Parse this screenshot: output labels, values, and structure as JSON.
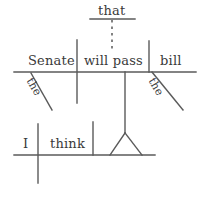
{
  "diagram": {
    "kind": "reed-kellogg-sentence-diagram",
    "sentence": "I think that the Senate will pass the bill.",
    "ink_color": "#555555",
    "text_color": "#3a3a3a",
    "background_color": "#ffffff",
    "width": 202,
    "height": 200,
    "labels": {
      "that": "that",
      "senate": "Senate",
      "will_pass": "will pass",
      "bill": "bill",
      "the_left": "the",
      "the_right": "the",
      "i": "I",
      "think": "think"
    },
    "clauses": {
      "main_clause": {
        "subject": "I",
        "verb": "think",
        "baseline_y": 155,
        "baseline_x1": 14,
        "baseline_x2": 155
      },
      "subordinate_clause": {
        "conjunction": "that",
        "subject": "Senate",
        "subject_modifier": "the",
        "verb": "will pass",
        "object": "bill",
        "object_modifier": "the",
        "baseline_y": 72,
        "baseline_x1": 14,
        "baseline_x2": 196
      }
    },
    "strokes": {
      "upper_baseline": "14,72 to 196,72",
      "upper_subject_verb_divider": "77,40 to 77,103",
      "upper_verb_object_divider": "149,41 to 149,72",
      "that_line": "90,19 to 135,19",
      "that_dotted_connector": "112,19 to 112,52",
      "modifier_the_left": "31,73 to 52,110",
      "modifier_the_right": "152,72 to 183,110",
      "lower_baseline": "14,155 to 155,155",
      "lower_subject_verb_divider": "38,124 to 38,183",
      "lower_object_divider": "93,122 to 93,155",
      "stand_stem": "125,72 to 125,133",
      "stand_triangle_left": "125,133 to 110,155",
      "stand_triangle_right": "125,133 to 142,155"
    }
  }
}
